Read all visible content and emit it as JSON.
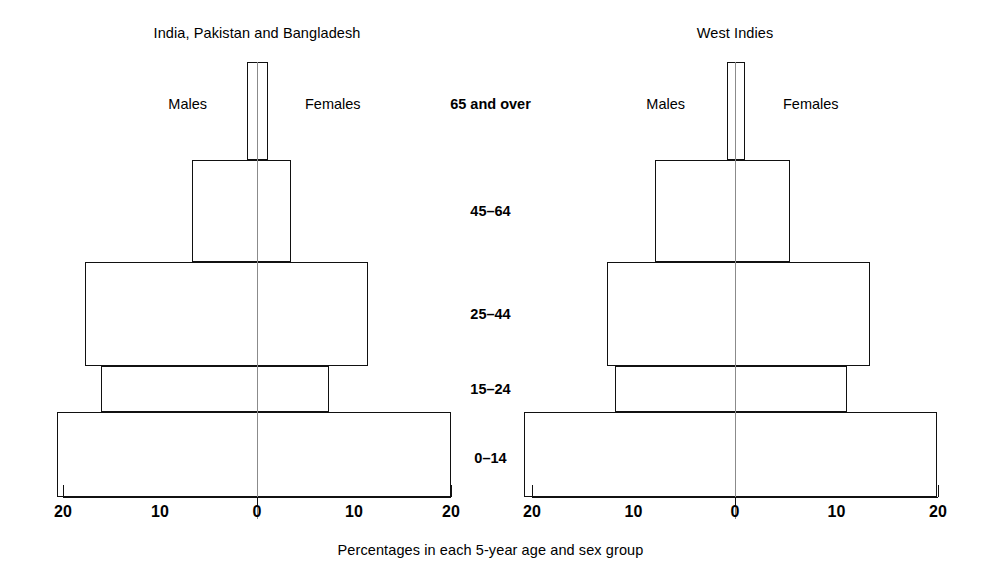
{
  "figure": {
    "caption": "Percentages in each 5-year age and sex group",
    "age_labels": [
      "65 and   over",
      "45–64",
      "25–44",
      "15–24",
      "0–14"
    ],
    "line_color": "#111111",
    "center_line_color": "#8b8b8b",
    "background": "#ffffff"
  },
  "panels": [
    {
      "id": "india-pakistan-bangladesh",
      "title": "India, Pakistan and Bangladesh",
      "males_label": "Males",
      "females_label": "Females",
      "tick_labels": [
        "20",
        "10",
        "0",
        "10",
        "20"
      ]
    },
    {
      "id": "west-indies",
      "title": "West Indies",
      "males_label": "Males",
      "females_label": "Females",
      "tick_labels": [
        "20",
        "10",
        "0",
        "10",
        "20"
      ]
    }
  ],
  "chart_data": [
    {
      "type": "bar",
      "subtype": "population-pyramid",
      "title": "India, Pakistan and Bangladesh",
      "xlabel": "Percentages in each 5-year age and sex group",
      "ylabel": "",
      "categories": [
        "0–14",
        "15–24",
        "25–44",
        "45–64",
        "65 and over"
      ],
      "series": [
        {
          "name": "Males",
          "side": "left",
          "values": [
            22.0,
            17.1,
            18.9,
            7.1,
            1.1
          ]
        },
        {
          "name": "Females",
          "side": "right",
          "values": [
            21.3,
            7.9,
            12.2,
            3.7,
            1.2
          ]
        }
      ],
      "xlim": [
        -22,
        22
      ],
      "xticks": [
        20,
        10,
        0,
        10,
        20
      ],
      "grid": false,
      "legend": "inline-top"
    },
    {
      "type": "bar",
      "subtype": "population-pyramid",
      "title": "West Indies",
      "xlabel": "Percentages in each 5-year age and sex group",
      "ylabel": "",
      "categories": [
        "0–14",
        "15–24",
        "25–44",
        "45–64",
        "65 and over"
      ],
      "series": [
        {
          "name": "Males",
          "side": "left",
          "values": [
            22.9,
            13.0,
            13.9,
            8.7,
            0.9
          ]
        },
        {
          "name": "Females",
          "side": "right",
          "values": [
            22.0,
            12.2,
            14.7,
            6.0,
            1.1
          ]
        }
      ],
      "xlim": [
        -22,
        22
      ],
      "xticks": [
        20,
        10,
        0,
        10,
        20
      ],
      "grid": false,
      "legend": "inline-top"
    }
  ],
  "geometry": {
    "baseline_y": 497,
    "rows": [
      {
        "category": "65 and over",
        "top": 62,
        "bottom": 160
      },
      {
        "category": "45–64",
        "top": 160,
        "bottom": 262
      },
      {
        "category": "25–44",
        "top": 262,
        "bottom": 366
      },
      {
        "category": "15–24",
        "top": 366,
        "bottom": 412
      },
      {
        "category": "0–14",
        "top": 412,
        "bottom": 497
      }
    ],
    "panels": [
      {
        "center_x": 257,
        "px_per_unit": 9.1,
        "axis_half_width": 194
      },
      {
        "center_x": 735,
        "px_per_unit": 9.2,
        "axis_half_width": 203
      }
    ],
    "age_label_y": [
      96,
      203,
      306,
      381,
      450
    ]
  }
}
